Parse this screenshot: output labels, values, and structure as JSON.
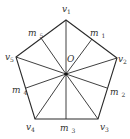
{
  "diagram": {
    "title": "",
    "shape": "regular-pentagon",
    "center": {
      "name": "O",
      "x": 66,
      "y": 74
    },
    "vertices": [
      {
        "name": "v",
        "sub": "1",
        "x": 66,
        "y": 20,
        "lx": 62,
        "ly": 12
      },
      {
        "name": "v",
        "sub": "2",
        "x": 117,
        "y": 58,
        "lx": 118,
        "ly": 62
      },
      {
        "name": "v",
        "sub": "3",
        "x": 98,
        "y": 119,
        "lx": 100,
        "ly": 130
      },
      {
        "name": "v",
        "sub": "4",
        "x": 35,
        "y": 119,
        "lx": 26,
        "ly": 130
      },
      {
        "name": "v",
        "sub": "5",
        "x": 16,
        "y": 57,
        "lx": 5,
        "ly": 60
      }
    ],
    "midpoints": [
      {
        "name": "m",
        "sub": "1",
        "x": 92,
        "y": 39,
        "lx": 90,
        "ly": 36
      },
      {
        "name": "m",
        "sub": "2",
        "x": 107,
        "y": 88,
        "lx": 110,
        "ly": 95
      },
      {
        "name": "m",
        "sub": "3",
        "x": 66,
        "y": 119,
        "lx": 60,
        "ly": 131
      },
      {
        "name": "m",
        "sub": "4",
        "x": 26,
        "y": 88,
        "lx": 12,
        "ly": 93
      },
      {
        "name": "m",
        "sub": "5",
        "x": 41,
        "y": 38,
        "lx": 28,
        "ly": 36
      }
    ],
    "center_label": {
      "text": "O",
      "x": 67,
      "y": 62
    }
  }
}
